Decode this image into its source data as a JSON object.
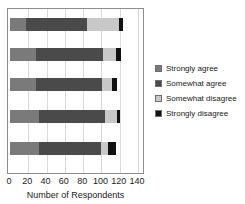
{
  "chart_data": {
    "type": "bar",
    "orientation": "horizontal",
    "stacked": true,
    "title": "",
    "xlabel": "Number of Respondents",
    "ylabel": "",
    "xlim": [
      0,
      140
    ],
    "xticks": [
      0,
      20,
      40,
      60,
      80,
      100,
      120,
      140
    ],
    "xtick_labels": [
      "0",
      "20",
      "40",
      "60",
      "80",
      "100",
      "120",
      "140"
    ],
    "grid": true,
    "grid_axis": "x",
    "legend_position": "right",
    "categories": [
      "Item 1",
      "Item 2",
      "Item 3",
      "Item 4",
      "Item 5"
    ],
    "series": [
      {
        "name": "Strongly agree",
        "color": "#7a7a7a",
        "values": [
          17,
          28,
          28,
          32,
          32
        ]
      },
      {
        "name": "Somewhat agree",
        "color": "#4a4a4a",
        "values": [
          67,
          74,
          73,
          72,
          67
        ]
      },
      {
        "name": "Somewhat disagree",
        "color": "#c8c8c8",
        "values": [
          35,
          14,
          11,
          13,
          8
        ]
      },
      {
        "name": "Strongly disagree",
        "color": "#111111",
        "values": [
          5,
          5,
          5,
          3,
          9
        ]
      }
    ],
    "bar_totals": [
      124,
      121,
      117,
      120,
      116
    ]
  },
  "legend": {
    "items": [
      {
        "label": "Strongly agree",
        "color": "#7a7a7a"
      },
      {
        "label": "Somewhat agree",
        "color": "#4a4a4a"
      },
      {
        "label": "Somewhat disagree",
        "color": "#c8c8c8"
      },
      {
        "label": "Strongly disagree",
        "color": "#111111"
      }
    ]
  },
  "axis": {
    "x_title": "Number of Respondents"
  },
  "style": {
    "frame_color": "#8d8d8d",
    "gridline_color": "#d9d9d9",
    "background": "#ffffff",
    "text_color": "#1a1a1a"
  }
}
